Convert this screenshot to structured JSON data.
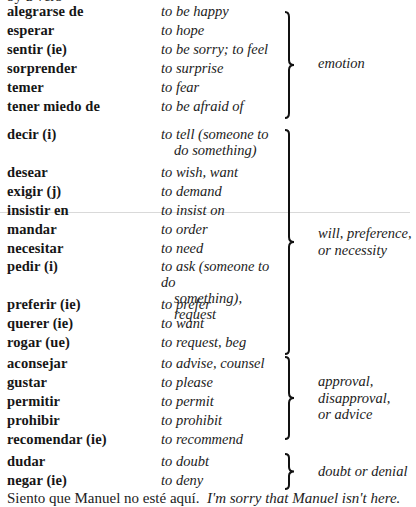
{
  "top_cut_text": "by a verb",
  "groups": [
    {
      "label": "emotion",
      "rows": [
        {
          "verb": "alegrarse de",
          "gloss": "to be happy",
          "gloss_cont": ""
        },
        {
          "verb": "esperar",
          "gloss": "to hope",
          "gloss_cont": ""
        },
        {
          "verb": "sentir (ie)",
          "gloss": "to be sorry; to feel",
          "gloss_cont": ""
        },
        {
          "verb": "sorprender",
          "gloss": "to surprise",
          "gloss_cont": ""
        },
        {
          "verb": "temer",
          "gloss": "to fear",
          "gloss_cont": ""
        },
        {
          "verb": "tener miedo de",
          "gloss": "to be afraid of",
          "gloss_cont": ""
        }
      ]
    },
    {
      "label": "will, preference, or necessity",
      "label_lines": [
        "will, preference,",
        "or necessity"
      ],
      "rows": [
        {
          "verb": "decir (i)",
          "gloss": "to tell (someone to",
          "gloss_cont": "do something)"
        },
        {
          "verb": "desear",
          "gloss": "to wish, want",
          "gloss_cont": ""
        },
        {
          "verb": "exigir (j)",
          "gloss": "to demand",
          "gloss_cont": ""
        },
        {
          "verb": "insistir en",
          "gloss": "to insist on",
          "gloss_cont": ""
        },
        {
          "verb": "mandar",
          "gloss": "to order",
          "gloss_cont": ""
        },
        {
          "verb": "necesitar",
          "gloss": "to need",
          "gloss_cont": ""
        },
        {
          "verb": "pedir (i)",
          "gloss": "to ask (someone to do",
          "gloss_cont": "something), request"
        },
        {
          "verb": "preferir (ie)",
          "gloss": "to prefer",
          "gloss_cont": ""
        },
        {
          "verb": "querer (ie)",
          "gloss": "to want",
          "gloss_cont": ""
        },
        {
          "verb": "rogar (ue)",
          "gloss": "to request, beg",
          "gloss_cont": ""
        }
      ]
    },
    {
      "label": "approval, disapproval, or advice",
      "label_lines": [
        "approval,",
        "disapproval,",
        "or advice"
      ],
      "rows": [
        {
          "verb": "aconsejar",
          "gloss": "to advise, counsel",
          "gloss_cont": ""
        },
        {
          "verb": "gustar",
          "gloss": "to please",
          "gloss_cont": ""
        },
        {
          "verb": "permitir",
          "gloss": "to permit",
          "gloss_cont": ""
        },
        {
          "verb": "prohibir",
          "gloss": "to prohibit",
          "gloss_cont": ""
        },
        {
          "verb": "recomendar (ie)",
          "gloss": "to recommend",
          "gloss_cont": ""
        }
      ]
    },
    {
      "label": "doubt or denial",
      "label_lines": [
        "doubt or denial"
      ],
      "rows": [
        {
          "verb": "dudar",
          "gloss": "to doubt",
          "gloss_cont": ""
        },
        {
          "verb": "negar (ie)",
          "gloss": "to deny",
          "gloss_cont": ""
        }
      ]
    }
  ],
  "example": {
    "spanish": "Siento que Manuel no esté aquí.",
    "english": "I'm sorry that Manuel isn't here."
  }
}
